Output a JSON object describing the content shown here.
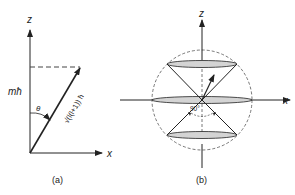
{
  "panel_a": {
    "caption": "(a)",
    "z_label": "z",
    "x_label": "x",
    "projection_label": "mħ",
    "angle_label": "θ",
    "vector_label": "√(l(l+1)) ħ"
  },
  "panel_b": {
    "caption": "(b)",
    "z_label": "z",
    "x_label": "x",
    "angle_label": "90°"
  },
  "colors": {
    "line": "#222222",
    "disk_fill": "#d4d4d4",
    "dashed": "#555555"
  }
}
